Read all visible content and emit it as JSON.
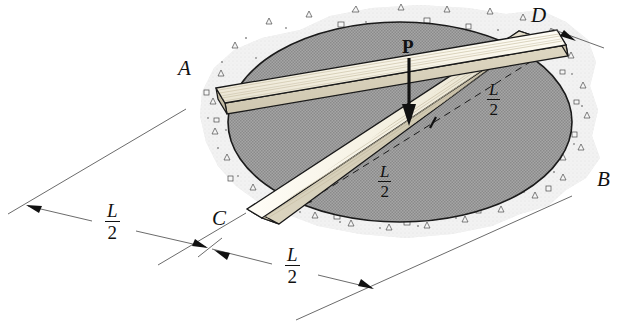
{
  "figure": {
    "labels": {
      "point_a": "A",
      "point_b": "B",
      "point_c": "C",
      "point_d": "D",
      "force": "P"
    },
    "dimensions": [
      {
        "id": "ab-left-half",
        "numerator": "L",
        "denominator": "2"
      },
      {
        "id": "ab-right-half",
        "numerator": "L",
        "denominator": "2"
      },
      {
        "id": "cd-upper-half",
        "numerator": "L",
        "denominator": "2"
      },
      {
        "id": "cd-lower-half",
        "numerator": "L",
        "denominator": "2"
      }
    ],
    "colors": {
      "outline": "#1a1a1a",
      "plank_top": "#f7f4ea",
      "plank_side": "#ded8c6",
      "plank_end": "#cfc8b4",
      "opening_gray": "#9b9b9b",
      "concrete_gray": "#dcdcdc",
      "aggregate": "#f2f2f2",
      "dimension_line": "#5a5a5a",
      "background": "#ffffff"
    }
  }
}
